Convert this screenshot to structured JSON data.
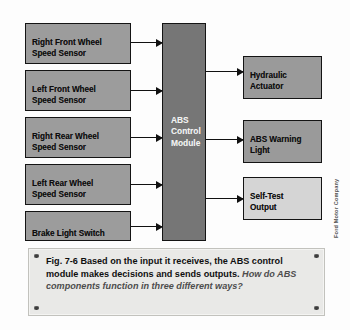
{
  "diagram": {
    "inputs": [
      {
        "label": "Right Front Wheel\nSpeed Sensor"
      },
      {
        "label": "Left Front Wheel\nSpeed Sensor"
      },
      {
        "label": "Right Rear Wheel\nSpeed Sensor"
      },
      {
        "label": "Left Rear Wheel\nSpeed Sensor"
      },
      {
        "label": "Brake Light Switch"
      }
    ],
    "module": {
      "label": "ABS\nControl\nModule"
    },
    "outputs": [
      {
        "label": "Hydraulic\nActuator"
      },
      {
        "label": "ABS Warning\nLight"
      },
      {
        "label": "Self-Test\nOutput"
      }
    ],
    "credit": "Ford Motor Company",
    "colors": {
      "node_fill": "#9a9a9a",
      "node_fill_light": "#d5d5d5",
      "module_fill": "#767676",
      "module_text": "#f2f2f2",
      "stroke": "#141414",
      "caption_fill": "#e9e9e7"
    }
  },
  "caption": {
    "figure_number": "Fig. 7-6",
    "body": "Based on the input it receives, the ABS control module makes decisions and sends outputs.",
    "question": "How do ABS components function in three different ways?"
  }
}
